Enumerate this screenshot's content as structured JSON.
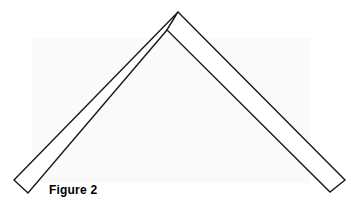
{
  "figure": {
    "caption": "Figure 2",
    "background_color": "#ffffff",
    "panel_color": "#fafafa",
    "stroke_color": "#1a1a1a",
    "fill_color": "#ffffff",
    "stroke_width": 1.4
  },
  "chart_data": {
    "type": "diagram",
    "title": "Figure 2",
    "xlabel": "",
    "ylabel": "",
    "xlim": [
      0,
      359
    ],
    "ylim": [
      0,
      209
    ],
    "grid": false,
    "legend": "none",
    "shapes": [
      {
        "name": "left-bar",
        "kind": "polygon",
        "points": [
          [
            178,
            12
          ],
          [
            167,
            30
          ],
          [
            28,
            193
          ],
          [
            14,
            180
          ]
        ],
        "fill": "#ffffff",
        "stroke": "#1a1a1a"
      },
      {
        "name": "right-bar",
        "kind": "polygon",
        "points": [
          [
            178,
            12
          ],
          [
            345,
            180
          ],
          [
            330,
            192
          ],
          [
            167,
            30
          ]
        ],
        "fill": "#ffffff",
        "stroke": "#1a1a1a"
      }
    ],
    "annotations": [
      {
        "text": "Figure 2",
        "x": 49,
        "y": 192,
        "bold": true
      }
    ]
  }
}
